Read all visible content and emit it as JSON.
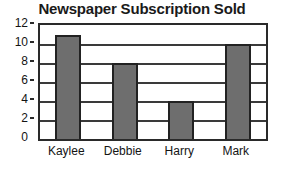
{
  "chart_data": {
    "type": "bar",
    "title": "Newspaper Subscription Sold",
    "xlabel": "",
    "ylabel": "",
    "categories": [
      "Kaylee",
      "Debbie",
      "Harry",
      "Mark"
    ],
    "values": [
      11,
      8,
      4,
      10
    ],
    "ylim": [
      0,
      12
    ],
    "ytick_labels": [
      "0",
      "2",
      "4",
      "6",
      "8",
      "10",
      "12"
    ],
    "ytick_values": [
      0,
      2,
      4,
      6,
      8,
      10,
      12
    ],
    "grid": true,
    "legend": null,
    "colors": {
      "bar_fill": "#6e6e6e",
      "bar_border": "#222222",
      "plot_background": "#ffffff",
      "axis": "#2a2a2a",
      "gridline": "#3a3a3a",
      "text": "#141414",
      "title": "#1a1a1a"
    }
  }
}
